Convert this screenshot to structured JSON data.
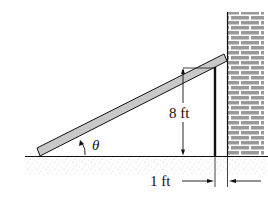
{
  "diagram": {
    "type": "ladder-against-wall",
    "labels": {
      "height": "8 ft",
      "gap": "1 ft",
      "angle": "θ"
    },
    "colors": {
      "plank_fill": "#c8c8c8",
      "brick_fill": "#a0a0a0",
      "mortar": "#ffffff",
      "ink": "#111111",
      "ground_speckle": "#b5b5b5"
    }
  }
}
